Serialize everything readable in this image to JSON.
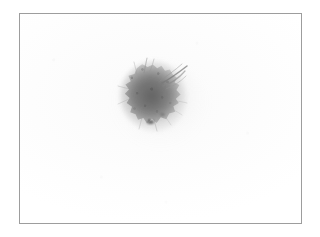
{
  "page": {
    "width": 320,
    "height": 237,
    "background_color": "#ffffff",
    "caption": ""
  },
  "plate": {
    "name": "specimen-plate",
    "border_color": "#9d9d9d",
    "border_width_px": 1,
    "background_color": "#fdfdfd",
    "bounds": {
      "x": 19,
      "y": 13,
      "width": 283,
      "height": 211
    },
    "label": ""
  },
  "specimen": {
    "name": "dark-blot",
    "description": "fuzzy dark gray circular blot",
    "center": {
      "x": 150,
      "y": 93
    },
    "bounds": {
      "x": 119,
      "y": 60,
      "width": 66,
      "height": 70
    },
    "core_color": "#6d6d6d",
    "mid_color": "#8c8c8c",
    "edge_color": "#c4c4c4",
    "halo_color": "#e6e6e6",
    "texture": "granular",
    "features": [
      {
        "name": "spike-upper-right",
        "from": {
          "x": 160,
          "y": 78
        },
        "to": {
          "x": 184,
          "y": 64
        }
      },
      {
        "name": "spike-upper-right-2",
        "from": {
          "x": 158,
          "y": 80
        },
        "to": {
          "x": 178,
          "y": 70
        }
      },
      {
        "name": "spike-top",
        "from": {
          "x": 146,
          "y": 72
        },
        "to": {
          "x": 150,
          "y": 58
        }
      },
      {
        "name": "dark-speck-bottom",
        "at": {
          "x": 148,
          "y": 122
        }
      }
    ]
  },
  "smudge": {
    "name": "faint-lower-smudge",
    "bounds": {
      "x": 111,
      "y": 65,
      "width": 96,
      "height": 86
    },
    "color": "#d2d2d2",
    "opacity": 0.18
  },
  "icons": {
    "plate_frame": "rectangle-frame-icon",
    "blot": "blot-icon"
  }
}
